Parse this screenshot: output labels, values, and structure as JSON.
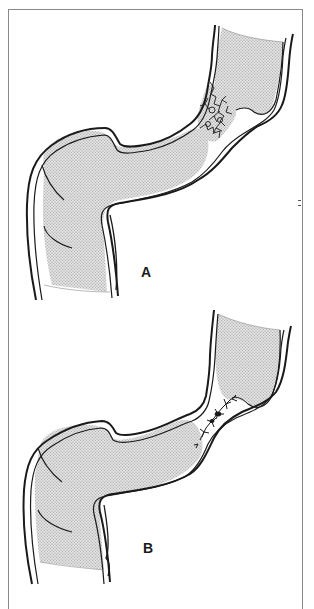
{
  "figure": {
    "panels": [
      {
        "id": "A",
        "label": "A",
        "depicts": "stomach and duodenal bulb with irregular stellate lesion at the pyloric channel"
      },
      {
        "id": "B",
        "label": "B",
        "depicts": "stomach and duodenal bulb with narrowed, linear stellate scar at the pyloric channel"
      }
    ],
    "colors": {
      "outline": "#1a1a1a",
      "stipple": "#b8b8b8",
      "frame": "#8a8a8a",
      "background": "#ffffff"
    }
  }
}
